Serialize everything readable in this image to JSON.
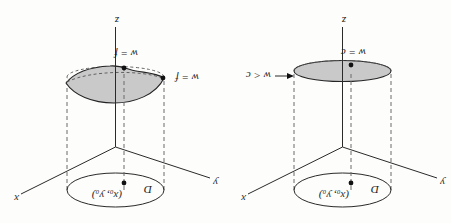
{
  "figure": {
    "caption": "",
    "orientation": "rotated-180",
    "background_color": "#fdfdfc",
    "ink_color": "#2a2a2a",
    "shade_color": "#c9c9c9",
    "panels": [
      {
        "id": "left",
        "name": "constant-surface-panel",
        "domain_label": "D",
        "point_label": "(x₀, y₀)",
        "axis_x": "x",
        "axis_y": "y",
        "axis_z": "z",
        "surface_label": "w = c",
        "edge_label": "w < c",
        "surface_type": "flat-disk"
      },
      {
        "id": "right",
        "name": "function-surface-panel",
        "domain_label": "D",
        "point_label": "(x₀, y₀)",
        "axis_x": "x",
        "axis_y": "y",
        "axis_z": "z",
        "surface_label": "w = f",
        "edge_label": "w = f",
        "surface_type": "curved-sheet"
      }
    ]
  }
}
